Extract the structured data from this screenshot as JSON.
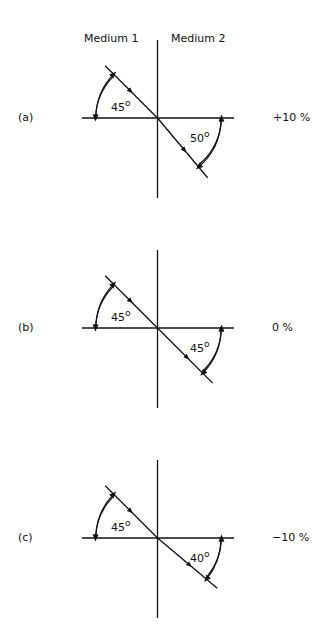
{
  "header": {
    "medium_1": "Medium 1",
    "medium_2": "Medium 2"
  },
  "panels": [
    {
      "id": "a",
      "label": "(a)",
      "incident_angle": "45",
      "refracted_angle": "50",
      "percent": "+10 %",
      "refracted_deg": 50
    },
    {
      "id": "b",
      "label": "(b)",
      "incident_angle": "45",
      "refracted_angle": "45",
      "percent": "0 %",
      "refracted_deg": 45
    },
    {
      "id": "c",
      "label": "(c)",
      "incident_angle": "45",
      "refracted_angle": "40",
      "percent": "−10 %",
      "refracted_deg": 40
    }
  ],
  "colors": {
    "line": "#111111",
    "background": "#ffffff"
  }
}
